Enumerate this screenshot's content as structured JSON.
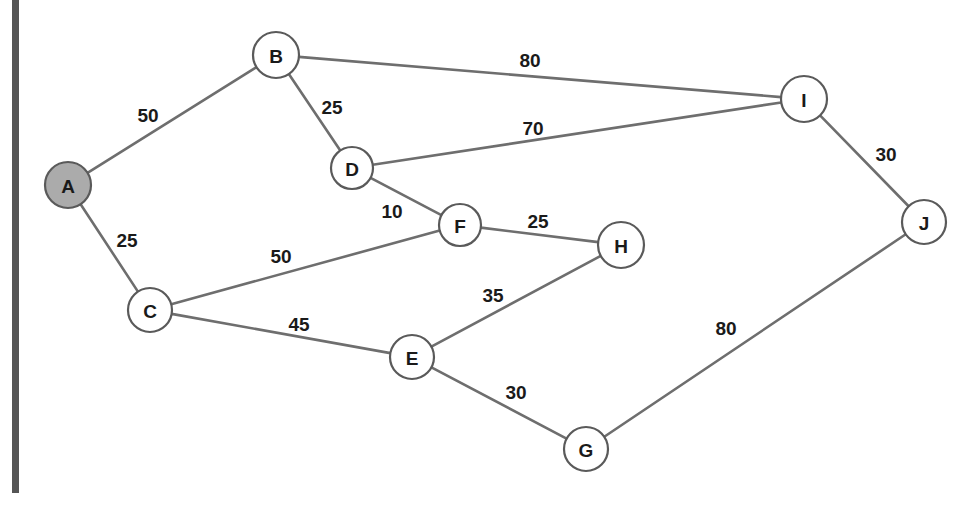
{
  "diagram": {
    "type": "weighted-undirected-graph",
    "title": "",
    "canvas": {
      "width": 980,
      "height": 505,
      "background": "#ffffff"
    },
    "colors": {
      "node_fill": "#ffffff",
      "node_highlight_fill": "#ababab",
      "node_stroke": "#5a5a5a",
      "edge_stroke": "#6e6e6e",
      "label_text": "#1a1a1a",
      "page_border": "#555555"
    },
    "nodes": [
      {
        "id": "A",
        "label": "A",
        "x": 68,
        "y": 185,
        "r": 23,
        "highlighted": true
      },
      {
        "id": "B",
        "label": "B",
        "x": 276,
        "y": 55,
        "r": 23,
        "highlighted": false
      },
      {
        "id": "C",
        "label": "C",
        "x": 150,
        "y": 310,
        "r": 22,
        "highlighted": false
      },
      {
        "id": "D",
        "label": "D",
        "x": 352,
        "y": 168,
        "r": 21,
        "highlighted": false
      },
      {
        "id": "E",
        "label": "E",
        "x": 412,
        "y": 357,
        "r": 22,
        "highlighted": false
      },
      {
        "id": "F",
        "label": "F",
        "x": 460,
        "y": 225,
        "r": 21,
        "highlighted": false
      },
      {
        "id": "G",
        "label": "G",
        "x": 586,
        "y": 449,
        "r": 22,
        "highlighted": false
      },
      {
        "id": "H",
        "label": "H",
        "x": 621,
        "y": 245,
        "r": 23,
        "highlighted": false
      },
      {
        "id": "I",
        "label": "I",
        "x": 804,
        "y": 99,
        "r": 23,
        "highlighted": false
      },
      {
        "id": "J",
        "label": "J",
        "x": 924,
        "y": 222,
        "r": 22,
        "highlighted": false
      }
    ],
    "edges": [
      {
        "source": "A",
        "target": "B",
        "weight": "50",
        "lx": 148,
        "ly": 115
      },
      {
        "source": "A",
        "target": "C",
        "weight": "25",
        "lx": 127,
        "ly": 240
      },
      {
        "source": "B",
        "target": "D",
        "weight": "25",
        "lx": 332,
        "ly": 107
      },
      {
        "source": "B",
        "target": "I",
        "weight": "80",
        "lx": 530,
        "ly": 60
      },
      {
        "source": "D",
        "target": "I",
        "weight": "70",
        "lx": 533,
        "ly": 128
      },
      {
        "source": "D",
        "target": "F",
        "weight": "10",
        "lx": 392,
        "ly": 211
      },
      {
        "source": "C",
        "target": "F",
        "weight": "50",
        "lx": 281,
        "ly": 256
      },
      {
        "source": "C",
        "target": "E",
        "weight": "45",
        "lx": 299,
        "ly": 324
      },
      {
        "source": "F",
        "target": "H",
        "weight": "25",
        "lx": 538,
        "ly": 221
      },
      {
        "source": "E",
        "target": "H",
        "weight": "35",
        "lx": 493,
        "ly": 295
      },
      {
        "source": "E",
        "target": "G",
        "weight": "30",
        "lx": 516,
        "ly": 392
      },
      {
        "source": "G",
        "target": "J",
        "weight": "80",
        "lx": 726,
        "ly": 328
      },
      {
        "source": "I",
        "target": "J",
        "weight": "30",
        "lx": 886,
        "ly": 154
      }
    ]
  }
}
